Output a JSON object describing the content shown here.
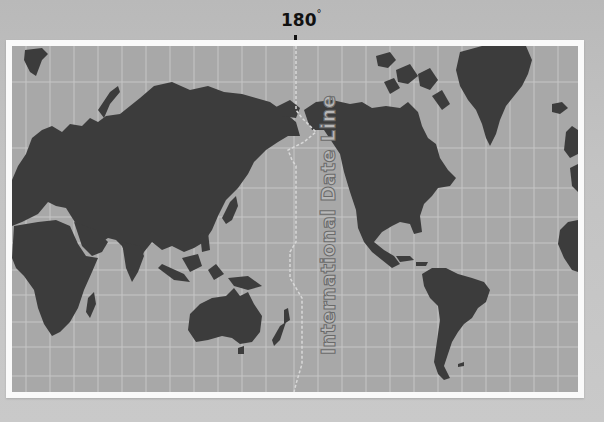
{
  "meridian": {
    "value": "180",
    "unit": "°"
  },
  "date_line": {
    "label": "International Date Line"
  },
  "map": {
    "projection": "Pacific-centered world map",
    "colors": {
      "ocean": "#a8a8a8",
      "land": "#3c3c3c",
      "grid": "#c4c4c4",
      "frame": "#fafafa",
      "background": "#c1c1c1"
    },
    "regions": [
      "Europe",
      "Africa",
      "Asia",
      "Australia",
      "New Zealand",
      "North America",
      "Greenland",
      "South America"
    ]
  }
}
